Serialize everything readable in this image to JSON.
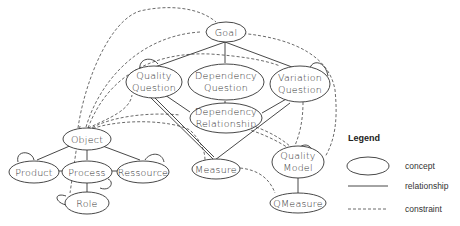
{
  "diagram": {
    "nodes": {
      "goal": "Goal",
      "quality_question_1": "Quality",
      "quality_question_2": "Question",
      "dependency_question_1": "Dependency",
      "dependency_question_2": "Question",
      "variation_question_1": "Variation",
      "variation_question_2": "Question",
      "dependency_relationship_1": "Dependency",
      "dependency_relationship_2": "Relationship",
      "object": "Object",
      "product": "Product",
      "process": "Process",
      "ressource": "Ressource",
      "role": "Role",
      "measure": "Measure",
      "quality_model_1": "Quality",
      "quality_model_2": "Model",
      "qmeasure": "QMeasure"
    },
    "relationships": [
      [
        "Goal",
        "Quality Question"
      ],
      [
        "Goal",
        "Dependency Question"
      ],
      [
        "Goal",
        "Variation Question"
      ],
      [
        "Quality Question",
        "Dependency Relationship"
      ],
      [
        "Dependency Question",
        "Dependency Relationship"
      ],
      [
        "Variation Question",
        "Dependency Relationship"
      ],
      [
        "Quality Question",
        "Measure"
      ],
      [
        "Variation Question",
        "Measure"
      ],
      [
        "Object",
        "Product"
      ],
      [
        "Object",
        "Process"
      ],
      [
        "Object",
        "Ressource"
      ],
      [
        "Product",
        "Process"
      ],
      [
        "Process",
        "Ressource"
      ],
      [
        "Process",
        "Role"
      ],
      [
        "Quality Model",
        "QMeasure"
      ]
    ],
    "self_loops": [
      "Quality Question",
      "Variation Question",
      "Product",
      "Process",
      "Ressource",
      "Role",
      "Quality Model"
    ],
    "constraints": [
      [
        "Object",
        "Goal"
      ],
      [
        "Object",
        "Quality Question"
      ],
      [
        "Object",
        "Dependency Relationship"
      ],
      [
        "Object",
        "Measure"
      ],
      [
        "Object",
        "Quality Model"
      ],
      [
        "Goal",
        "Quality Model"
      ],
      [
        "Measure",
        "QMeasure"
      ],
      [
        "Dependency Relationship",
        "Quality Model"
      ],
      [
        "Variation Question",
        "Quality Model"
      ],
      [
        "Role",
        "Object"
      ]
    ]
  },
  "legend": {
    "title": "Legend",
    "items": [
      {
        "symbol": "ellipse",
        "label": "concept"
      },
      {
        "symbol": "solid-line",
        "label": "relationship"
      },
      {
        "symbol": "dashed-line",
        "label": "constraint"
      }
    ]
  }
}
